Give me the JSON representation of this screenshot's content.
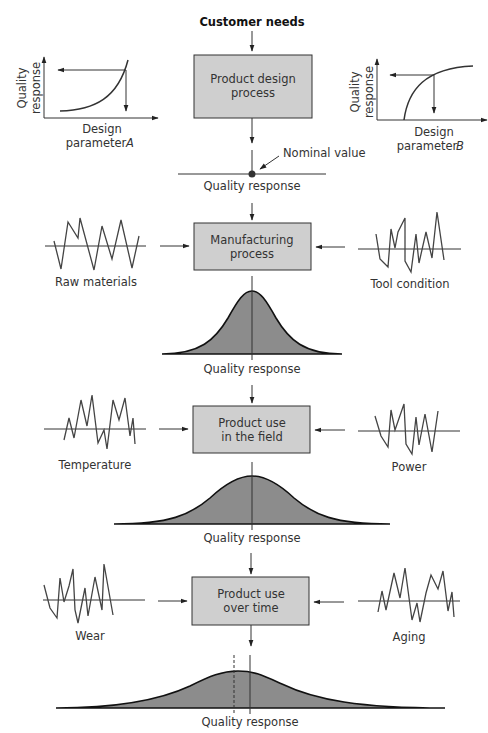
{
  "diagram": {
    "title": "Customer needs",
    "stages": [
      {
        "id": "design",
        "label_line1": "Product design",
        "label_line2": "process"
      },
      {
        "id": "manufacturing",
        "label_line1": "Manufacturing",
        "label_line2": "process"
      },
      {
        "id": "field",
        "label_line1": "Product use",
        "label_line2": "in the field"
      },
      {
        "id": "time",
        "label_line1": "Product use",
        "label_line2": "over time"
      }
    ],
    "design_graphs": {
      "left": {
        "ylabel_line1": "Quality",
        "ylabel_line2": "response",
        "xlabel_line1": "Design",
        "xlabel_line2": "parameter",
        "param": "A"
      },
      "right": {
        "ylabel_line1": "Quality",
        "ylabel_line2": "response",
        "xlabel_line1": "Design",
        "xlabel_line2": "parameter",
        "param": "B"
      }
    },
    "nominal_label": "Nominal value",
    "noise_factors": {
      "manufacturing": {
        "left": "Raw materials",
        "right": "Tool condition"
      },
      "field": {
        "left": "Temperature",
        "right": "Power"
      },
      "time": {
        "left": "Wear",
        "right": "Aging"
      }
    },
    "output_labels": [
      "Quality response",
      "Quality response",
      "Quality response",
      "Quality response"
    ],
    "colors": {
      "box_fill": "#cfcfcf",
      "bell_fill": "#8c8c8c",
      "line": "#333333"
    }
  }
}
